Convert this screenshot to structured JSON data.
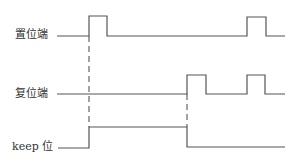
{
  "diagram": {
    "title": "",
    "type": "timing-diagram",
    "colors": {
      "line": "#555555",
      "text": "#333333",
      "background": "#ffffff"
    },
    "signals": [
      {
        "id": "set",
        "label": "置位端",
        "label_pos": {
          "x": 15,
          "y": 29
        },
        "points": "57,36 89,36 89,16 107,16 107,36 247,36 247,17 266,17 266,36 285,36"
      },
      {
        "id": "reset",
        "label": "复位端",
        "label_pos": {
          "x": 15,
          "y": 88
        },
        "points": "57,94 187,94 187,75 206,75 206,94 247,94 247,75 265,75 265,94 285,94"
      },
      {
        "id": "keep",
        "label": "keep 位",
        "label_pos": {
          "x": 12,
          "y": 141
        },
        "points": "58,148 89,148 89,127 187,127 187,147 285,147"
      }
    ],
    "guides": [
      {
        "id": "set-to-keep",
        "x": 89,
        "y1": 36,
        "y2": 127
      },
      {
        "id": "reset-to-keep",
        "x": 187,
        "y1": 94,
        "y2": 127
      }
    ]
  }
}
